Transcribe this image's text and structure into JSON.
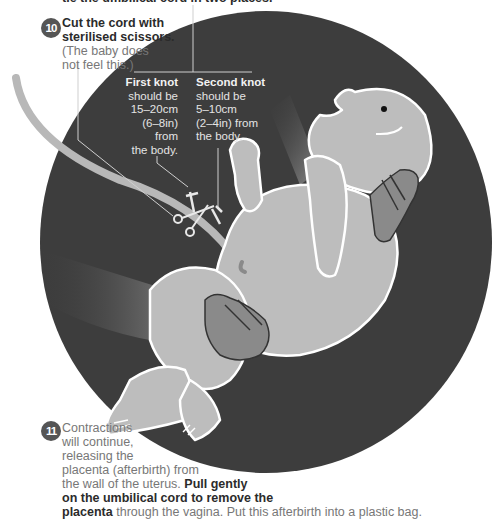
{
  "header_cut": "tie the umbilical cord in two places.",
  "step10": {
    "number": "10",
    "title_line1": "Cut the cord with",
    "title_line2": "sterilised scissors.",
    "note_line1": "(The baby does",
    "note_line2": "not feel this.)"
  },
  "first_knot": {
    "title": "First knot",
    "lines": [
      "should be",
      "15–20cm",
      "(6–8in) from",
      "the body."
    ]
  },
  "second_knot": {
    "title": "Second knot",
    "lines": [
      "should be",
      "5–10cm",
      "(2–4in) from",
      "the body."
    ]
  },
  "step11": {
    "number": "11",
    "lines": [
      "Contractions",
      "will continue,",
      "releasing the",
      "placenta (afterbirth) from"
    ],
    "line5_normal": "the wall of the uterus.",
    "line5_bold": "Pull gently",
    "line6_bold": "on the umbilical cord to remove the",
    "line7_bold": "placenta",
    "line7_normal": "through the vagina. Put this afterbirth into a plastic bag."
  },
  "colors": {
    "circle": "#3d3d3d",
    "skin": "#bdbdbd",
    "hand": "#8a8a8a",
    "outline": "#ffffff",
    "cord": "#b8b8b8",
    "badge": "#555555"
  }
}
